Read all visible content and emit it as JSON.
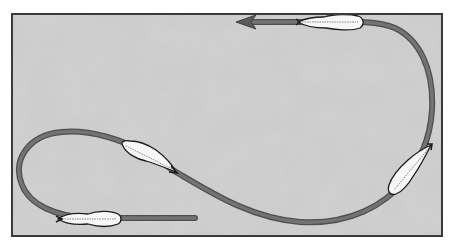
{
  "diagram": {
    "type": "flow-path",
    "colors": {
      "paper": "#c9c9c9",
      "paper_mottle": "#b8b8b8",
      "border": "#3a3a3a",
      "path": "#6e6e6e",
      "path_edge": "#4f4f4f",
      "feather_fill": "#f7f7f7",
      "feather_outline": "#1e1e1e"
    },
    "markers": [
      {
        "name": "feather-start",
        "position": "bottom-left"
      },
      {
        "name": "feather-loop",
        "position": "center-left"
      },
      {
        "name": "feather-right",
        "position": "right-lower"
      },
      {
        "name": "feather-top",
        "position": "top-right"
      }
    ],
    "arrowhead": {
      "direction": "left",
      "position": "top-center"
    }
  }
}
